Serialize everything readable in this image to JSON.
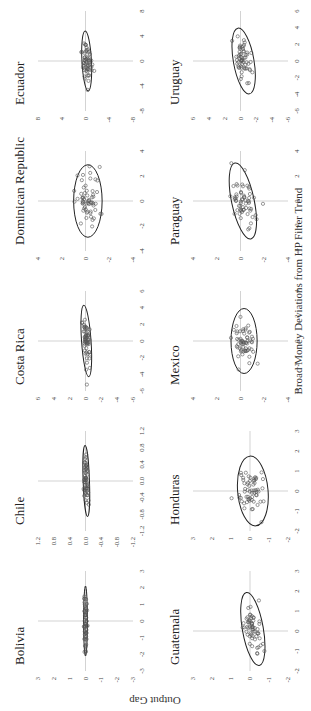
{
  "figure": {
    "x_axis_title": "Broad Money Deviations from HP Filter Trend",
    "y_axis_title": "Output Gap",
    "rotation": "page rotated 90 degrees counter-clockwise"
  },
  "chart_data": {
    "type": "scatter",
    "layout": {
      "rows": 2,
      "cols": 5,
      "overlay": "confidence ellipse",
      "grid": false,
      "reference_lines": "zero lines"
    },
    "xlabel": "Broad Money Deviations from HP Filter Trend",
    "ylabel": "Output Gap",
    "panels": [
      {
        "title": "Bolivia",
        "xlim": [
          -3,
          3
        ],
        "ylim": [
          -3,
          3
        ],
        "xticks": [
          "-3",
          "-2",
          "-1",
          "0",
          "1",
          "2",
          "3"
        ],
        "yticks": [
          "3",
          "2",
          "1",
          "0",
          "-1",
          "-2",
          "-3"
        ],
        "ellipse": {
          "cx": 0.0,
          "cy": 0.0,
          "rx": 2.1,
          "ry": 0.12,
          "angle": 0
        },
        "cloud": {
          "spread_x": 0.9,
          "spread_y": 0.05,
          "n": 60
        }
      },
      {
        "title": "Chile",
        "xlim": [
          -1.2,
          1.2
        ],
        "ylim": [
          -1.2,
          1.2
        ],
        "xticks": [
          "-1.2",
          "-0.8",
          "-0.4",
          "0.0",
          "0.4",
          "0.8",
          "1.2"
        ],
        "yticks": [
          "1.2",
          "0.8",
          "0.4",
          "0.0",
          "-0.4",
          "-0.8",
          "-1.2"
        ],
        "ellipse": {
          "cx": 0.0,
          "cy": -0.02,
          "rx": 0.85,
          "ry": 0.08,
          "angle": 2
        },
        "cloud": {
          "spread_x": 0.3,
          "spread_y": 0.03,
          "n": 60
        }
      },
      {
        "title": "Costa Rica",
        "xlim": [
          -6,
          6
        ],
        "ylim": [
          -6,
          6
        ],
        "xticks": [
          "-6",
          "-4",
          "-2",
          "0",
          "2",
          "4",
          "6"
        ],
        "yticks": [
          "6",
          "4",
          "2",
          "0",
          "-2",
          "-4",
          "-6"
        ],
        "ellipse": {
          "cx": 0.0,
          "cy": -0.1,
          "rx": 4.3,
          "ry": 0.6,
          "angle": 4
        },
        "cloud": {
          "spread_x": 1.5,
          "spread_y": 0.25,
          "n": 60
        }
      },
      {
        "title": "Dominican Republic",
        "xlim": [
          -4,
          4
        ],
        "ylim": [
          -4,
          4
        ],
        "xticks": [
          "-4",
          "-2",
          "0",
          "2",
          "4"
        ],
        "yticks": [
          "4",
          "2",
          "0",
          "-2",
          "-4"
        ],
        "ellipse": {
          "cx": 0.0,
          "cy": -0.2,
          "rx": 2.9,
          "ry": 1.2,
          "angle": 0
        },
        "cloud": {
          "spread_x": 1.0,
          "spread_y": 0.5,
          "n": 60
        }
      },
      {
        "title": "Ecuador",
        "xlim": [
          -8,
          8
        ],
        "ylim": [
          -8,
          8
        ],
        "xticks": [
          "-8",
          "-4",
          "0",
          "4",
          "8"
        ],
        "yticks": [
          "8",
          "4",
          "0",
          "-4",
          "-8"
        ],
        "ellipse": {
          "cx": 0.0,
          "cy": -0.2,
          "rx": 4.8,
          "ry": 0.8,
          "angle": 3
        },
        "cloud": {
          "spread_x": 1.6,
          "spread_y": 0.35,
          "n": 60
        }
      },
      {
        "title": "Guatemala",
        "xlim": [
          -2,
          3
        ],
        "ylim": [
          -2,
          3
        ],
        "xticks": [
          "-2",
          "-1",
          "0",
          "1",
          "2",
          "3"
        ],
        "yticks": [
          "3",
          "2",
          "1",
          "0",
          "-1",
          "-2"
        ],
        "ellipse": {
          "cx": 0.1,
          "cy": -0.15,
          "rx": 1.85,
          "ry": 0.55,
          "angle": 10
        },
        "cloud": {
          "spread_x": 0.6,
          "spread_y": 0.22,
          "n": 60
        }
      },
      {
        "title": "Honduras",
        "xlim": [
          -2,
          3
        ],
        "ylim": [
          -2,
          3
        ],
        "xticks": [
          "-2",
          "-1",
          "0",
          "1",
          "2",
          "3"
        ],
        "yticks": [
          "3",
          "2",
          "1",
          "0",
          "-1",
          "-2"
        ],
        "ellipse": {
          "cx": 0.0,
          "cy": -0.15,
          "rx": 1.75,
          "ry": 0.8,
          "angle": 5
        },
        "cloud": {
          "spread_x": 0.6,
          "spread_y": 0.35,
          "n": 60
        }
      },
      {
        "title": "Mexico",
        "xlim": [
          -4,
          4
        ],
        "ylim": [
          -4,
          4
        ],
        "xticks": [
          "-4",
          "-2",
          "0",
          "2",
          "4"
        ],
        "yticks": [
          "4",
          "2",
          "0",
          "-2",
          "-4"
        ],
        "ellipse": {
          "cx": 0.0,
          "cy": -0.3,
          "rx": 2.6,
          "ry": 1.1,
          "angle": 0
        },
        "cloud": {
          "spread_x": 0.8,
          "spread_y": 0.45,
          "n": 60
        }
      },
      {
        "title": "Paraguay",
        "xlim": [
          -4,
          4
        ],
        "ylim": [
          -4,
          4
        ],
        "xticks": [
          "-4",
          "-2",
          "0",
          "2",
          "4"
        ],
        "yticks": [
          "4",
          "2",
          "0",
          "-2",
          "-4"
        ],
        "ellipse": {
          "cx": 0.0,
          "cy": -0.2,
          "rx": 3.1,
          "ry": 0.95,
          "angle": 12
        },
        "cloud": {
          "spread_x": 1.0,
          "spread_y": 0.4,
          "n": 60
        }
      },
      {
        "title": "Uruguay",
        "xlim": [
          -6,
          6
        ],
        "ylim": [
          -6,
          6
        ],
        "xticks": [
          "-6",
          "-4",
          "-2",
          "0",
          "2",
          "4",
          "6"
        ],
        "yticks": [
          "6",
          "4",
          "2",
          "0",
          "-2",
          "-4",
          "-6"
        ],
        "ellipse": {
          "cx": 0.0,
          "cy": -0.4,
          "rx": 4.0,
          "ry": 1.3,
          "angle": 10
        },
        "cloud": {
          "spread_x": 1.3,
          "spread_y": 0.5,
          "n": 60
        }
      }
    ]
  }
}
